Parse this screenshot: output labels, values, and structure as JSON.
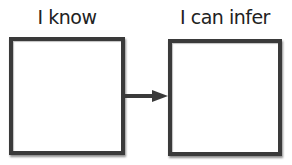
{
  "diagram": {
    "left": {
      "label": "I know"
    },
    "right": {
      "label": "I can infer"
    },
    "connector": {
      "direction": "left-to-right",
      "color": "#3a3a3a"
    }
  }
}
